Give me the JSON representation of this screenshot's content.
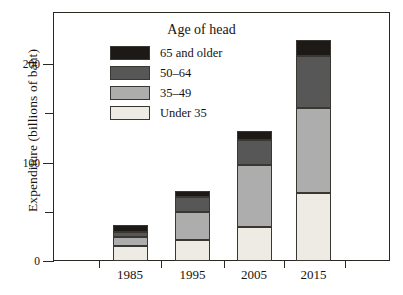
{
  "chart_data": {
    "type": "bar",
    "subtype": "stacked-bar",
    "title": "",
    "xlabel": "",
    "ylabel": "Expenditure (billions of baht)",
    "categories": [
      "1985",
      "1995",
      "2005",
      "2015"
    ],
    "series": [
      {
        "name": "Under 35",
        "color": "#edebe4",
        "values": [
          15,
          21,
          35,
          69
        ]
      },
      {
        "name": "35–49",
        "color": "#adadad",
        "values": [
          9,
          29,
          62,
          86
        ]
      },
      {
        "name": "50–64",
        "color": "#575757",
        "values": [
          5,
          15,
          26,
          53
        ]
      },
      {
        "name": "65 and older",
        "color": "#1c1917",
        "values": [
          8,
          6,
          9,
          16
        ]
      }
    ],
    "totals": [
      37,
      71,
      132,
      224
    ],
    "ylim": [
      0,
      250
    ],
    "yticks_major": [
      0,
      100,
      200
    ],
    "yticks_minor": [
      50,
      150
    ],
    "grid": false,
    "legend_title": "Age of head",
    "legend_position": "inside-top-left",
    "legend_order_top_to_bottom": [
      "65 and older",
      "50–64",
      "35–49",
      "Under 35"
    ]
  },
  "axes": {
    "y_tick_labels": [
      "0",
      "100",
      "200"
    ],
    "y_axis_title": "Expenditure (billions of baht)",
    "x_tick_labels": [
      "1985",
      "1995",
      "2005",
      "2015"
    ]
  },
  "legend": {
    "title": "Age of head",
    "items": [
      {
        "label": "65 and older",
        "color": "#1c1917"
      },
      {
        "label": "50–64",
        "color": "#575757"
      },
      {
        "label": "35–49",
        "color": "#adadad"
      },
      {
        "label": "Under 35",
        "color": "#edebe4"
      }
    ]
  },
  "colors": {
    "frame": "#2b2723",
    "text": "#17120f",
    "background": "#ffffff"
  }
}
